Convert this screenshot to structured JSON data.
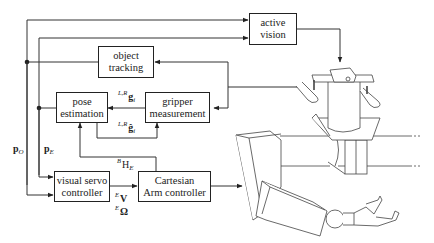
{
  "diagram": {
    "type": "control-block-diagram",
    "blocks": [
      {
        "id": "active-vision",
        "lines": [
          "active",
          "vision"
        ]
      },
      {
        "id": "object-tracking",
        "lines": [
          "object",
          "tracking"
        ]
      },
      {
        "id": "pose-estimation",
        "lines": [
          "pose",
          "estimation"
        ]
      },
      {
        "id": "gripper-measurement",
        "lines": [
          "gripper",
          "measurement"
        ]
      },
      {
        "id": "visual-servo-controller",
        "lines": [
          "visual servo",
          "controller"
        ]
      },
      {
        "id": "cartesian-arm-controller",
        "lines": [
          "Cartesian",
          "Arm controller"
        ]
      }
    ],
    "signals": {
      "g_measured": {
        "sup": "L,R",
        "base": "g",
        "sub": "i"
      },
      "g_estimated": {
        "sup": "L,R",
        "base": "ĝ",
        "sub": "i"
      },
      "p_o": {
        "base": "p",
        "sub": "O"
      },
      "p_e": {
        "base": "p",
        "sub": "E"
      },
      "b_h_e": {
        "sup": "B",
        "base": "H",
        "sub": "E"
      },
      "e_v": {
        "sup": "E",
        "base": "V"
      },
      "e_omega": {
        "sup": "E",
        "base": "Ω"
      }
    },
    "illustration": "robot arm with gripper and stereo camera head (active vision)"
  }
}
